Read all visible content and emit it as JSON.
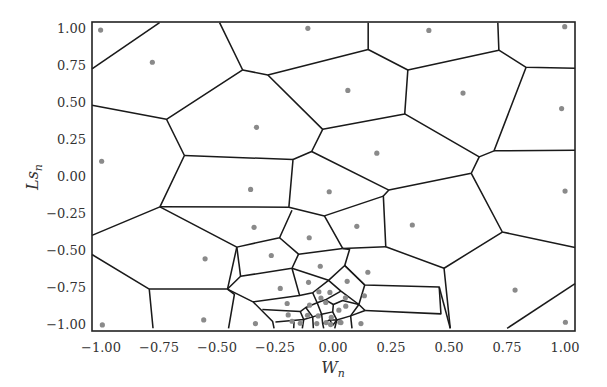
{
  "chart_data": {
    "type": "scatter",
    "subtype": "voronoi-diagram",
    "title": "",
    "xlabel": "W_n",
    "ylabel": "Ls_n",
    "xlim": [
      -1.0,
      1.0
    ],
    "ylim": [
      -1.0,
      1.0
    ],
    "grid": false,
    "legend": null,
    "x_ticks": [
      "−1.00",
      "−0.75",
      "−0.50",
      "−0.25",
      "0.00",
      "0.25",
      "0.50",
      "0.75",
      "1.00"
    ],
    "y_ticks": [
      "1.00",
      "0.75",
      "0.50",
      "0.25",
      "0.00",
      "−0.25",
      "−0.50",
      "−0.75",
      "−1.00"
    ],
    "point_color": "#8a8a8a",
    "edge_color": "#1a1a1a",
    "points": [
      {
        "x": -0.99,
        "y": 0.98
      },
      {
        "x": -0.78,
        "y": 0.78
      },
      {
        "x": -0.03,
        "y": 0.99
      },
      {
        "x": 0.41,
        "y": 0.98
      },
      {
        "x": 0.99,
        "y": 1.0
      },
      {
        "x": 0.11,
        "y": 0.58
      },
      {
        "x": 0.55,
        "y": 0.56
      },
      {
        "x": 0.98,
        "y": 0.47
      },
      {
        "x": -0.33,
        "y": 0.34
      },
      {
        "x": 0.18,
        "y": 0.17
      },
      {
        "x": -0.98,
        "y": 0.12
      },
      {
        "x": -0.36,
        "y": -0.07
      },
      {
        "x": -0.03,
        "y": -0.09
      },
      {
        "x": 0.99,
        "y": -0.09
      },
      {
        "x": -0.35,
        "y": -0.33
      },
      {
        "x": 0.11,
        "y": -0.33
      },
      {
        "x": 0.33,
        "y": -0.31
      },
      {
        "x": -0.11,
        "y": -0.4
      },
      {
        "x": -0.21,
        "y": -0.51
      },
      {
        "x": -0.55,
        "y": -0.54
      },
      {
        "x": -0.06,
        "y": -0.61
      },
      {
        "x": 0.15,
        "y": -0.64
      },
      {
        "x": -0.15,
        "y": -0.74
      },
      {
        "x": -0.05,
        "y": -0.72
      },
      {
        "x": 0.07,
        "y": -0.71
      },
      {
        "x": 0.78,
        "y": -0.75
      },
      {
        "x": -0.01,
        "y": -0.78
      },
      {
        "x": 0.03,
        "y": -0.79
      },
      {
        "x": 0.07,
        "y": -0.8
      },
      {
        "x": 0.14,
        "y": -0.8
      },
      {
        "x": -0.17,
        "y": -0.86
      },
      {
        "x": -0.11,
        "y": -0.86
      },
      {
        "x": -0.06,
        "y": -0.83
      },
      {
        "x": -0.03,
        "y": -0.86
      },
      {
        "x": 0.03,
        "y": -0.85
      },
      {
        "x": 0.06,
        "y": -0.88
      },
      {
        "x": -0.16,
        "y": -0.91
      },
      {
        "x": -0.09,
        "y": -0.91
      },
      {
        "x": -0.03,
        "y": -0.9
      },
      {
        "x": 0.01,
        "y": -0.91
      },
      {
        "x": 0.05,
        "y": -0.9
      },
      {
        "x": -0.57,
        "y": -0.96
      },
      {
        "x": -0.35,
        "y": -0.98
      },
      {
        "x": -0.13,
        "y": -0.97
      },
      {
        "x": -0.1,
        "y": -0.98
      },
      {
        "x": -0.05,
        "y": -0.98
      },
      {
        "x": -0.01,
        "y": -0.97
      },
      {
        "x": 0.0,
        "y": -0.98
      },
      {
        "x": 0.04,
        "y": -0.97
      },
      {
        "x": 0.12,
        "y": -0.98
      },
      {
        "x": -0.98,
        "y": -0.99
      },
      {
        "x": 0.99,
        "y": -0.97
      }
    ],
    "sites_px_frame": [
      [
        121,
        66
      ],
      [
        271,
        162
      ],
      [
        722,
        61
      ],
      [
        1073,
        67
      ],
      [
        1467,
        56
      ],
      [
        838,
        246
      ],
      [
        1172,
        254
      ],
      [
        1458,
        300
      ],
      [
        573,
        356
      ],
      [
        922,
        433
      ],
      [
        124,
        457
      ],
      [
        556,
        541
      ],
      [
        784,
        548
      ],
      [
        1468,
        546
      ],
      [
        566,
        654
      ],
      [
        864,
        651
      ],
      [
        1025,
        647
      ],
      [
        726,
        685
      ],
      [
        616,
        738
      ],
      [
        424,
        748
      ],
      [
        758,
        770
      ],
      [
        896,
        788
      ],
      [
        642,
        836
      ],
      [
        724,
        818
      ],
      [
        836,
        815
      ],
      [
        1323,
        841
      ],
      [
        754,
        846
      ],
      [
        786,
        848
      ],
      [
        831,
        864
      ],
      [
        886,
        858
      ],
      [
        662,
        881
      ],
      [
        727,
        886
      ],
      [
        760,
        865
      ],
      [
        774,
        878
      ],
      [
        812,
        901
      ],
      [
        832,
        889
      ],
      [
        665,
        915
      ],
      [
        721,
        916
      ],
      [
        752,
        918
      ],
      [
        790,
        922
      ],
      [
        815,
        937
      ],
      [
        420,
        930
      ],
      [
        570,
        941
      ],
      [
        676,
        934
      ],
      [
        700,
        940
      ],
      [
        748,
        941
      ],
      [
        775,
        938
      ],
      [
        788,
        944
      ],
      [
        818,
        938
      ],
      [
        876,
        941
      ],
      [
        126,
        945
      ],
      [
        1469,
        937
      ]
    ],
    "edges_px_frame": [
      "96,182 292,44",
      "96,290 312,332 533,185 466,44",
      "312,332 364,440 293,593 96,678",
      "533,185 606,200 897,124 897,44",
      "606,200 765,362 733,428 679,452 667,594 770,620 823,717",
      "897,124 1012,185 1276,126 1273,44",
      "1012,185 1003,316 765,362",
      "1276,126 1355,177 1497,180",
      "1355,177 1262,426 1219,444 1003,316",
      "1262,426 1497,424",
      "1219,444 1196,493 957,543 733,428",
      "364,440 679,452",
      "1196,493 1286,668 1497,714",
      "1286,668 1117,776 1135,955",
      "1117,776 948,712 941,561 957,543",
      "1497,822 1300,955",
      "941,561 770,620",
      "293,593 667,594",
      "293,593 516,713 640,685 676,603",
      "96,735 262,838 273,955",
      "262,838 489,838 516,713",
      "640,685 695,734 823,717",
      "695,734 676,776 527,800 489,838",
      "823,717 948,712",
      "823,717 843,720 829,768",
      "516,713 527,800",
      "489,838 563,876 620,935 624,955",
      "489,838 509,854 492,955",
      "676,776 698,857 563,876",
      "676,776 782,812 829,768 887,826 1103,832 1108,912 888,902",
      "829,768 887,826",
      "887,826 870,884 888,902",
      "698,857 736,849 782,812",
      "782,812 818,844 870,884",
      "736,849 749,879 716,893 700,905 590,899",
      "749,879 773,870 818,844",
      "773,870 796,884 823,872 870,884",
      "796,884 794,906 762,913 749,879",
      "762,913 765,941 768,955",
      "700,905 710,929 628,936",
      "710,929 706,955",
      "716,893 736,921 710,929",
      "736,921 762,913",
      "794,906 806,930 800,955",
      "806,930 846,918 870,884",
      "846,918 850,955",
      "888,902 846,918",
      "765,941 785,930 806,930",
      "785,930 795,945 806,930",
      "681,955 682,935",
      "736,921 738,955",
      "1103,832 1135,955"
    ]
  }
}
